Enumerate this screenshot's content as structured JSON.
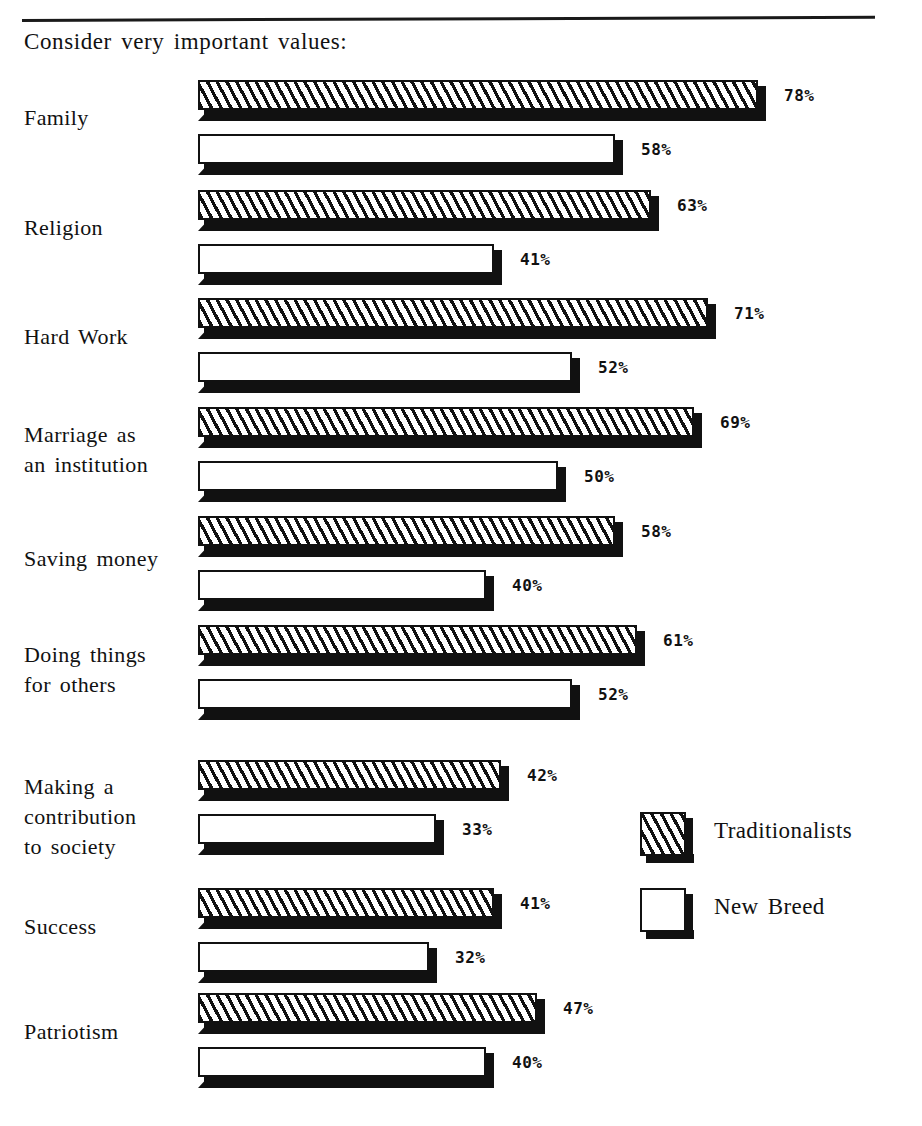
{
  "chart_data": {
    "type": "bar",
    "orientation": "horizontal",
    "title": "Consider very important values:",
    "xlabel": "",
    "ylabel": "",
    "xlim": [
      0,
      100
    ],
    "grid": false,
    "value_suffix": "%",
    "legend_position": "right-lower",
    "categories": [
      "Family",
      "Religion",
      "Hard Work",
      "Marriage as\nan institution",
      "Saving money",
      "Doing things\nfor others",
      "Making a\ncontribution\nto society",
      "Success",
      "Patriotism"
    ],
    "series": [
      {
        "name": "Traditionalists",
        "pattern": "diagonal-hatch",
        "values": [
          78,
          63,
          71,
          69,
          58,
          61,
          42,
          41,
          47
        ],
        "labels": [
          "78%",
          "63%",
          "71%",
          "69%",
          "58%",
          "61%",
          "42%",
          "41%",
          "47%"
        ]
      },
      {
        "name": "New Breed",
        "pattern": "solid-white",
        "values": [
          58,
          41,
          52,
          50,
          40,
          52,
          33,
          32,
          40
        ],
        "labels": [
          "58%",
          "41%",
          "52%",
          "50%",
          "40%",
          "52%",
          "33%",
          "32%",
          "40%"
        ]
      }
    ]
  },
  "legend": {
    "items": [
      {
        "label": "Traditionalists",
        "pattern": "diagonal-hatch"
      },
      {
        "label": "New Breed",
        "pattern": "solid-white"
      }
    ]
  },
  "colors": {
    "ink": "#111111",
    "paper": "#ffffff"
  }
}
